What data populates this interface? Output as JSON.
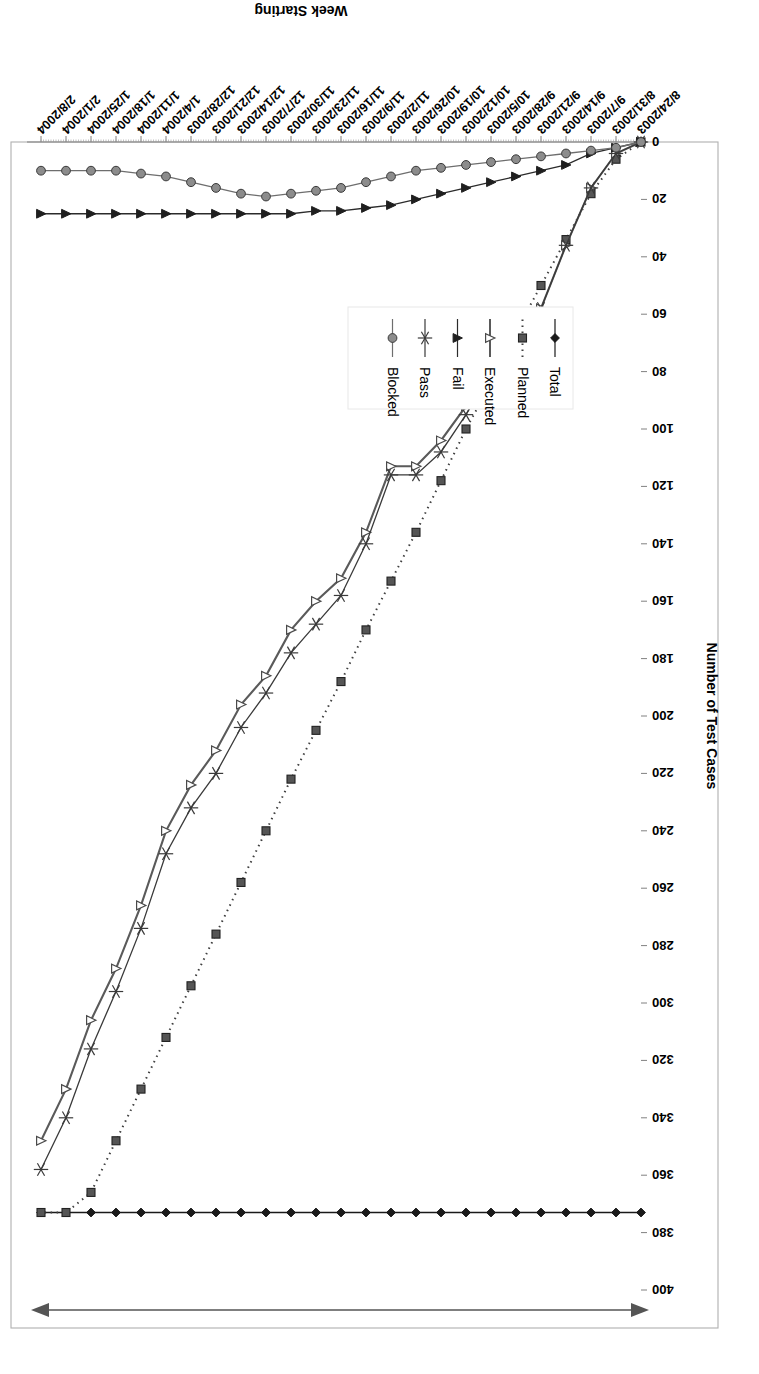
{
  "chart_data": {
    "type": "line",
    "title": "",
    "xlabel": "Week Starting",
    "ylabel": "Number of Test Cases",
    "ylim": [
      0,
      400
    ],
    "ytick_step": 20,
    "yticks": [
      0,
      20,
      40,
      60,
      80,
      100,
      120,
      140,
      160,
      180,
      200,
      220,
      240,
      260,
      280,
      300,
      320,
      340,
      360,
      380,
      400
    ],
    "grid": false,
    "legend_position": "inside-lower-left",
    "x_tick_rotation": "-45",
    "categories": [
      "8/24/2003",
      "8/31/2003",
      "9/7/2003",
      "9/14/2003",
      "9/21/2003",
      "9/28/2003",
      "10/5/2003",
      "10/12/2003",
      "10/19/2003",
      "10/26/2003",
      "11/2/2003",
      "11/9/2003",
      "11/16/2003",
      "11/23/2003",
      "11/30/2003",
      "12/7/2003",
      "12/14/2003",
      "12/21/2003",
      "12/28/2003",
      "1/4/2004",
      "1/11/2004",
      "1/18/2004",
      "1/25/2004",
      "2/1/2004",
      "2/8/2004"
    ],
    "series": [
      {
        "name": "Total",
        "color": "#1a1a1a",
        "marker": "diamond",
        "dash": "none",
        "values": [
          373,
          373,
          373,
          373,
          373,
          373,
          373,
          373,
          373,
          373,
          373,
          373,
          373,
          373,
          373,
          373,
          373,
          373,
          373,
          373,
          373,
          373,
          373,
          373,
          373
        ]
      },
      {
        "name": "Planned",
        "color": "#3f3f3f",
        "marker": "square",
        "dash": "dotted",
        "values": [
          0,
          6,
          18,
          34,
          50,
          66,
          84,
          100,
          118,
          136,
          153,
          170,
          188,
          205,
          222,
          240,
          258,
          276,
          294,
          312,
          330,
          348,
          366,
          373,
          373
        ]
      },
      {
        "name": "Executed",
        "color": "#5a5a5a",
        "marker": "triangle-open",
        "dash": "none",
        "values": [
          0,
          4,
          16,
          36,
          58,
          66,
          78,
          92,
          104,
          113,
          113,
          136,
          152,
          160,
          170,
          186,
          196,
          212,
          224,
          240,
          266,
          288,
          306,
          330,
          348
        ]
      },
      {
        "name": "Fail",
        "color": "#2b2b2b",
        "marker": "triangle-left",
        "dash": "none",
        "values": [
          0,
          2,
          4,
          8,
          10,
          12,
          14,
          16,
          18,
          20,
          22,
          23,
          24,
          24,
          25,
          25,
          25,
          25,
          25,
          25,
          25,
          25,
          25,
          25,
          25
        ]
      },
      {
        "name": "Pass",
        "color": "#3a3a3a",
        "marker": "asterisk",
        "dash": "none",
        "values": [
          0,
          4,
          16,
          36,
          58,
          66,
          80,
          95,
          108,
          116,
          116,
          140,
          158,
          168,
          178,
          192,
          204,
          220,
          232,
          248,
          274,
          296,
          316,
          340,
          358
        ]
      },
      {
        "name": "Blocked",
        "color": "#6e6e6e",
        "marker": "circle",
        "dash": "none",
        "values": [
          0,
          2,
          3,
          4,
          5,
          6,
          7,
          8,
          9,
          10,
          12,
          14,
          16,
          17,
          18,
          19,
          18,
          16,
          14,
          12,
          11,
          10,
          10,
          10,
          10
        ]
      }
    ],
    "annotation": {
      "type": "double-headed-arrow",
      "label": ""
    }
  },
  "legend": {
    "items": [
      {
        "label": "Total"
      },
      {
        "label": "Planned"
      },
      {
        "label": "Executed"
      },
      {
        "label": "Fail"
      },
      {
        "label": "Pass"
      },
      {
        "label": "Blocked"
      }
    ]
  }
}
